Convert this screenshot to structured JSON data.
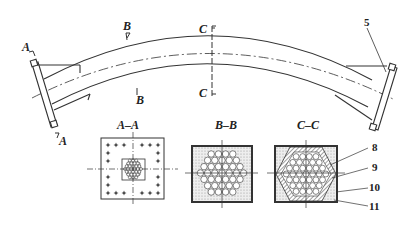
{
  "figure": {
    "section_marks": {
      "a_top": "A",
      "a_bottom": "A",
      "b_top": "B",
      "b_bottom": "B",
      "c_top": "C",
      "c_bottom": "C"
    },
    "sections": [
      {
        "id": "A-A",
        "title": "A–A"
      },
      {
        "id": "B-B",
        "title": "B–B"
      },
      {
        "id": "C-C",
        "title": "C–C"
      }
    ],
    "callouts": {
      "c5": "5",
      "c8": "8",
      "c9": "9",
      "c10": "10",
      "c11": "11"
    },
    "colors": {
      "line": "#333333",
      "fill_stipple": "#d9d9d9",
      "background": "#ffffff"
    }
  }
}
